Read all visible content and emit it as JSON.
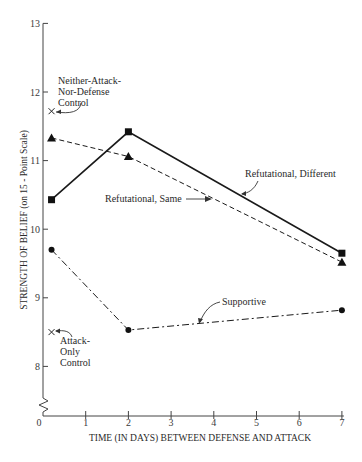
{
  "chart_data": {
    "type": "line",
    "title": "",
    "xlabel": "TIME (IN DAYS) BETWEEN DEFENSE AND ATTACK",
    "ylabel": "STRENGTH OF BELIEF (on 15 - Point Scale)",
    "xlim": [
      0,
      7
    ],
    "ylim": [
      7.3,
      13
    ],
    "y_axis_break": true,
    "grid": false,
    "x_ticks": [
      0,
      1,
      2,
      3,
      4,
      5,
      6,
      7
    ],
    "x_tick_labels": [
      "0",
      "1",
      "2",
      "3",
      "4",
      "5",
      "6",
      "7"
    ],
    "y_ticks": [
      8,
      9,
      10,
      11,
      12,
      13
    ],
    "y_tick_labels": [
      "8",
      "9",
      "10",
      "11",
      "12",
      "13"
    ],
    "series": [
      {
        "name": "Refutational, Different",
        "marker": "square",
        "line_style": "solid",
        "x": [
          0.2,
          2,
          7
        ],
        "values": [
          10.43,
          11.42,
          9.65
        ]
      },
      {
        "name": "Refutational, Same",
        "marker": "triangle",
        "line_style": "dashed",
        "x": [
          0.2,
          2,
          7
        ],
        "values": [
          11.33,
          11.06,
          9.52
        ]
      },
      {
        "name": "Supportive",
        "marker": "circle",
        "line_style": "dash-dot",
        "x": [
          0.2,
          2,
          7
        ],
        "values": [
          9.7,
          8.53,
          8.82
        ]
      }
    ],
    "controls": [
      {
        "name": "Neither-Attack-Nor-Defense Control",
        "label_lines": [
          "Neither-Attack-",
          "Nor-Defense",
          "Control"
        ],
        "marker": "x",
        "x": 0.2,
        "value": 11.72
      },
      {
        "name": "Attack-Only Control",
        "label_lines": [
          "Attack-",
          "Only",
          "Control"
        ],
        "marker": "x",
        "x": 0.2,
        "value": 8.5
      }
    ],
    "annotations": [
      {
        "text": "Refutational, Different",
        "target": "Refutational, Different"
      },
      {
        "text": "Refutational, Same",
        "target": "Refutational, Same"
      },
      {
        "text": "Supportive",
        "target": "Supportive"
      }
    ]
  }
}
